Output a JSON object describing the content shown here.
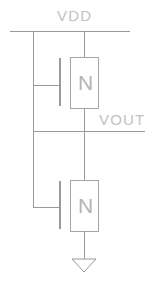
{
  "diagram": {
    "type": "circuit-schematic",
    "background_color": "#ffffff",
    "wire_color": "#9a9a9a",
    "label_color": "#c2c2c2",
    "device_letter_color": "#b4b4b4",
    "labels": {
      "vdd": "VDD",
      "vout": "VOUT"
    },
    "devices": [
      {
        "id": "m1",
        "letter": "N",
        "role": "load-transistor",
        "position": "top"
      },
      {
        "id": "m2",
        "letter": "N",
        "role": "driver-transistor",
        "position": "bottom"
      }
    ],
    "nets": [
      {
        "name": "VDD",
        "kind": "supply-rail"
      },
      {
        "name": "VOUT",
        "kind": "output-node"
      },
      {
        "name": "GND",
        "kind": "ground",
        "symbol": "triangle-arrow"
      }
    ]
  }
}
